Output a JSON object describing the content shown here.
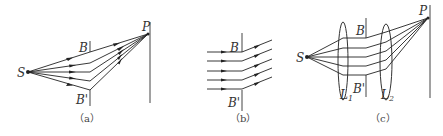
{
  "figure": {
    "panels": [
      {
        "id": "a",
        "caption": "（a）",
        "labels": {
          "source": "S",
          "slit_top": "B",
          "slit_bottom": "B'",
          "point": "P"
        }
      },
      {
        "id": "b",
        "caption": "（b）",
        "labels": {
          "slit_top": "B",
          "slit_bottom": "B'"
        }
      },
      {
        "id": "c",
        "caption": "（c）",
        "labels": {
          "source": "S",
          "slit_top": "B",
          "slit_bottom": "B'",
          "point": "P",
          "lens1": "L",
          "lens1_sub": "1",
          "lens2": "L",
          "lens2_sub": "2"
        }
      }
    ],
    "colors": {
      "line": "#222222",
      "wall": "#444444",
      "text": "#333333"
    }
  }
}
